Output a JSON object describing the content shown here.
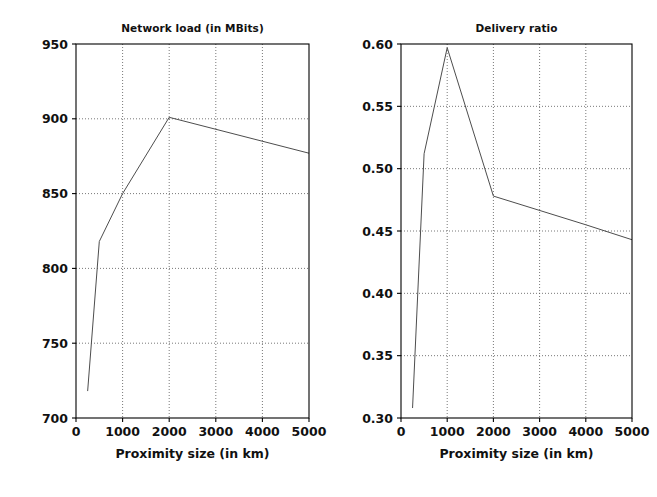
{
  "figure": {
    "width": 657,
    "height": 497,
    "background": "#ffffff",
    "line_color": "#4d4d4d",
    "grid_color": "#555555",
    "axis_color": "#000000"
  },
  "chart_data": [
    {
      "type": "line",
      "id": "network-load",
      "title": "Network load (in MBits)",
      "xlabel": "Proximity size (in km)",
      "ylabel": "",
      "xlim": [
        0,
        5000
      ],
      "ylim": [
        700,
        950
      ],
      "grid": true,
      "legend": null,
      "xticks": [
        0,
        1000,
        2000,
        3000,
        4000,
        5000
      ],
      "xticklabels": [
        "0",
        "1000",
        "2000",
        "3000",
        "4000",
        "5000"
      ],
      "yticks": [
        700,
        750,
        800,
        850,
        900,
        950
      ],
      "yticklabels": [
        "700",
        "750",
        "800",
        "850",
        "900",
        "950"
      ],
      "x": [
        250,
        500,
        1000,
        2000,
        5000
      ],
      "y": [
        718,
        818,
        850,
        901,
        877
      ],
      "series": [
        {
          "name": "Network load",
          "x": [
            250,
            500,
            1000,
            2000,
            5000
          ],
          "values": [
            718,
            818,
            850,
            901,
            877
          ]
        }
      ]
    },
    {
      "type": "line",
      "id": "delivery-ratio",
      "title": "Delivery ratio",
      "xlabel": "Proximity size (in km)",
      "ylabel": "",
      "xlim": [
        0,
        5000
      ],
      "ylim": [
        0.3,
        0.6
      ],
      "grid": true,
      "legend": null,
      "xticks": [
        0,
        1000,
        2000,
        3000,
        4000,
        5000
      ],
      "xticklabels": [
        "0",
        "1000",
        "2000",
        "3000",
        "4000",
        "5000"
      ],
      "yticks": [
        0.3,
        0.35,
        0.4,
        0.45,
        0.5,
        0.55,
        0.6
      ],
      "yticklabels": [
        "0.30",
        "0.35",
        "0.40",
        "0.45",
        "0.50",
        "0.55",
        "0.60"
      ],
      "x": [
        250,
        500,
        1000,
        2000,
        4000,
        5000
      ],
      "y": [
        0.308,
        0.512,
        0.597,
        0.478,
        0.455,
        0.443
      ],
      "series": [
        {
          "name": "Delivery ratio",
          "x": [
            250,
            500,
            1000,
            2000,
            4000,
            5000
          ],
          "values": [
            0.308,
            0.512,
            0.597,
            0.478,
            0.455,
            0.443
          ]
        }
      ]
    }
  ]
}
